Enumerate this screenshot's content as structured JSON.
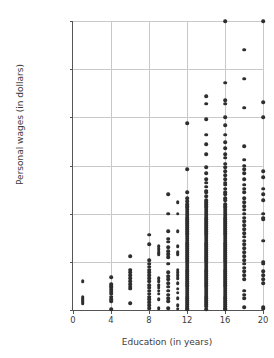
{
  "chart_data": {
    "type": "scatter",
    "title": "",
    "xlabel": "Education (in years)",
    "ylabel": "Personal wages (in dollars)",
    "xlim": [
      0,
      20
    ],
    "ylim": [
      0,
      150000
    ],
    "xticks": [
      0,
      4,
      8,
      12,
      16,
      20
    ],
    "xtick_labels": [
      "0",
      "4",
      "8",
      "12",
      "16",
      "20"
    ],
    "yticks": [
      0,
      25000,
      50000,
      75000,
      100000,
      125000,
      150000
    ],
    "ytick_labels": [
      "0",
      "25,000",
      "50,000",
      "75,000",
      "100,000",
      "125,000",
      "150,000"
    ],
    "grid": "horizontal-and-vertical",
    "legend": "none",
    "marker_color": "#2e2e2e",
    "grid_color": "#c9c9c9",
    "axis_color": "#555555",
    "points": [
      [
        1,
        15000
      ],
      [
        1,
        6500
      ],
      [
        1,
        5500
      ],
      [
        1,
        4500
      ],
      [
        1,
        3500
      ],
      [
        4,
        17000
      ],
      [
        4,
        13500
      ],
      [
        4,
        12500
      ],
      [
        4,
        11500
      ],
      [
        4,
        10500
      ],
      [
        4,
        9500
      ],
      [
        4,
        8500
      ],
      [
        4,
        7000
      ],
      [
        4,
        5500
      ],
      [
        4,
        4500
      ],
      [
        4,
        500
      ],
      [
        6,
        28000
      ],
      [
        6,
        21000
      ],
      [
        6,
        19500
      ],
      [
        6,
        18000
      ],
      [
        6,
        16500
      ],
      [
        6,
        15000
      ],
      [
        6,
        13500
      ],
      [
        6,
        12000
      ],
      [
        6,
        11000
      ],
      [
        6,
        3500
      ],
      [
        8,
        39000
      ],
      [
        8,
        34000
      ],
      [
        8,
        26000
      ],
      [
        8,
        24000
      ],
      [
        8,
        22500
      ],
      [
        8,
        21000
      ],
      [
        8,
        19500
      ],
      [
        8,
        18000
      ],
      [
        8,
        16500
      ],
      [
        8,
        15000
      ],
      [
        8,
        13000
      ],
      [
        8,
        11500
      ],
      [
        8,
        10000
      ],
      [
        8,
        8500
      ],
      [
        8,
        7000
      ],
      [
        8,
        5500
      ],
      [
        8,
        4000
      ],
      [
        8,
        2500
      ],
      [
        8,
        800
      ],
      [
        9,
        33000
      ],
      [
        9,
        31500
      ],
      [
        9,
        30000
      ],
      [
        9,
        29000
      ],
      [
        9,
        16500
      ],
      [
        9,
        15000
      ],
      [
        9,
        13000
      ],
      [
        9,
        11500
      ],
      [
        9,
        10000
      ],
      [
        9,
        8500
      ],
      [
        9,
        5500
      ],
      [
        9,
        1000
      ],
      [
        10,
        60000
      ],
      [
        10,
        50000
      ],
      [
        10,
        41000
      ],
      [
        10,
        37000
      ],
      [
        10,
        35500
      ],
      [
        10,
        32500
      ],
      [
        10,
        30500
      ],
      [
        10,
        29000
      ],
      [
        10,
        27500
      ],
      [
        10,
        24000
      ],
      [
        10,
        19500
      ],
      [
        10,
        17500
      ],
      [
        10,
        16000
      ],
      [
        10,
        14000
      ],
      [
        10,
        12000
      ],
      [
        10,
        10000
      ],
      [
        10,
        8000
      ],
      [
        10,
        6000
      ],
      [
        10,
        4500
      ],
      [
        10,
        1000
      ],
      [
        11,
        56000
      ],
      [
        11,
        50000
      ],
      [
        11,
        41000
      ],
      [
        11,
        33000
      ],
      [
        11,
        30000
      ],
      [
        11,
        29000
      ],
      [
        11,
        21000
      ],
      [
        11,
        19500
      ],
      [
        11,
        18000
      ],
      [
        11,
        16500
      ],
      [
        11,
        14000
      ],
      [
        11,
        11000
      ],
      [
        11,
        9000
      ],
      [
        11,
        6000
      ],
      [
        11,
        2500
      ],
      [
        11,
        700
      ],
      [
        12,
        97000
      ],
      [
        12,
        73000
      ],
      [
        12,
        61000
      ],
      [
        12,
        58000
      ],
      [
        12,
        56500
      ],
      [
        12,
        55000
      ],
      [
        12,
        54000
      ],
      [
        12,
        53000
      ],
      [
        12,
        52000
      ],
      [
        12,
        51000
      ],
      [
        12,
        50000
      ],
      [
        12,
        49000
      ],
      [
        12,
        48000
      ],
      [
        12,
        47000
      ],
      [
        12,
        46000
      ],
      [
        12,
        45000
      ],
      [
        12,
        44000
      ],
      [
        12,
        43000
      ],
      [
        12,
        42000
      ],
      [
        12,
        41000
      ],
      [
        12,
        40000
      ],
      [
        12,
        39000
      ],
      [
        12,
        38000
      ],
      [
        12,
        37000
      ],
      [
        12,
        36000
      ],
      [
        12,
        35000
      ],
      [
        12,
        34000
      ],
      [
        12,
        33000
      ],
      [
        12,
        32000
      ],
      [
        12,
        31000
      ],
      [
        12,
        30000
      ],
      [
        12,
        29000
      ],
      [
        12,
        28000
      ],
      [
        12,
        27000
      ],
      [
        12,
        26000
      ],
      [
        12,
        25000
      ],
      [
        12,
        24000
      ],
      [
        12,
        23000
      ],
      [
        12,
        22000
      ],
      [
        12,
        21000
      ],
      [
        12,
        20000
      ],
      [
        12,
        19000
      ],
      [
        12,
        18000
      ],
      [
        12,
        17000
      ],
      [
        12,
        16000
      ],
      [
        12,
        15000
      ],
      [
        12,
        14000
      ],
      [
        12,
        13000
      ],
      [
        12,
        12000
      ],
      [
        12,
        11000
      ],
      [
        12,
        10000
      ],
      [
        12,
        9000
      ],
      [
        12,
        8000
      ],
      [
        12,
        7000
      ],
      [
        12,
        6000
      ],
      [
        12,
        5000
      ],
      [
        12,
        4000
      ],
      [
        12,
        3000
      ],
      [
        12,
        2000
      ],
      [
        12,
        1000
      ],
      [
        12,
        300
      ],
      [
        14,
        111000
      ],
      [
        14,
        107000
      ],
      [
        14,
        99000
      ],
      [
        14,
        91000
      ],
      [
        14,
        86000
      ],
      [
        14,
        81000
      ],
      [
        14,
        74000
      ],
      [
        14,
        71000
      ],
      [
        14,
        68000
      ],
      [
        14,
        66000
      ],
      [
        14,
        64000
      ],
      [
        14,
        62000
      ],
      [
        14,
        61000
      ],
      [
        14,
        59000
      ],
      [
        14,
        57000
      ],
      [
        14,
        56000
      ],
      [
        14,
        55000
      ],
      [
        14,
        54000
      ],
      [
        14,
        53000
      ],
      [
        14,
        52000
      ],
      [
        14,
        51000
      ],
      [
        14,
        50000
      ],
      [
        14,
        49000
      ],
      [
        14,
        48000
      ],
      [
        14,
        47000
      ],
      [
        14,
        46000
      ],
      [
        14,
        45000
      ],
      [
        14,
        44000
      ],
      [
        14,
        43000
      ],
      [
        14,
        42000
      ],
      [
        14,
        41000
      ],
      [
        14,
        40000
      ],
      [
        14,
        39000
      ],
      [
        14,
        38000
      ],
      [
        14,
        37000
      ],
      [
        14,
        36000
      ],
      [
        14,
        35000
      ],
      [
        14,
        34000
      ],
      [
        14,
        33000
      ],
      [
        14,
        32000
      ],
      [
        14,
        31000
      ],
      [
        14,
        30000
      ],
      [
        14,
        29000
      ],
      [
        14,
        28000
      ],
      [
        14,
        27000
      ],
      [
        14,
        26000
      ],
      [
        14,
        25000
      ],
      [
        14,
        24000
      ],
      [
        14,
        23000
      ],
      [
        14,
        22000
      ],
      [
        14,
        21000
      ],
      [
        14,
        20000
      ],
      [
        14,
        19000
      ],
      [
        14,
        18000
      ],
      [
        14,
        17000
      ],
      [
        14,
        16000
      ],
      [
        14,
        15000
      ],
      [
        14,
        14000
      ],
      [
        14,
        13000
      ],
      [
        14,
        12000
      ],
      [
        14,
        11000
      ],
      [
        14,
        10000
      ],
      [
        14,
        9000
      ],
      [
        14,
        8000
      ],
      [
        14,
        7000
      ],
      [
        14,
        6000
      ],
      [
        14,
        5000
      ],
      [
        14,
        4000
      ],
      [
        14,
        3000
      ],
      [
        14,
        2000
      ],
      [
        14,
        500
      ],
      [
        16,
        150000
      ],
      [
        16,
        118000
      ],
      [
        16,
        109000
      ],
      [
        16,
        107000
      ],
      [
        16,
        100000
      ],
      [
        16,
        96000
      ],
      [
        16,
        91000
      ],
      [
        16,
        87000
      ],
      [
        16,
        84000
      ],
      [
        16,
        81000
      ],
      [
        16,
        79000
      ],
      [
        16,
        76000
      ],
      [
        16,
        74000
      ],
      [
        16,
        72000
      ],
      [
        16,
        70000
      ],
      [
        16,
        68000
      ],
      [
        16,
        66000
      ],
      [
        16,
        65000
      ],
      [
        16,
        63000
      ],
      [
        16,
        61000
      ],
      [
        16,
        60000
      ],
      [
        16,
        58000
      ],
      [
        16,
        57000
      ],
      [
        16,
        55000
      ],
      [
        16,
        54000
      ],
      [
        16,
        53000
      ],
      [
        16,
        52000
      ],
      [
        16,
        51000
      ],
      [
        16,
        50000
      ],
      [
        16,
        49000
      ],
      [
        16,
        48000
      ],
      [
        16,
        47000
      ],
      [
        16,
        46000
      ],
      [
        16,
        45000
      ],
      [
        16,
        44000
      ],
      [
        16,
        43000
      ],
      [
        16,
        42000
      ],
      [
        16,
        41000
      ],
      [
        16,
        40000
      ],
      [
        16,
        39000
      ],
      [
        16,
        38000
      ],
      [
        16,
        37000
      ],
      [
        16,
        36000
      ],
      [
        16,
        35000
      ],
      [
        16,
        34000
      ],
      [
        16,
        33000
      ],
      [
        16,
        32000
      ],
      [
        16,
        31000
      ],
      [
        16,
        30000
      ],
      [
        16,
        29000
      ],
      [
        16,
        28000
      ],
      [
        16,
        27000
      ],
      [
        16,
        26000
      ],
      [
        16,
        25000
      ],
      [
        16,
        24000
      ],
      [
        16,
        23000
      ],
      [
        16,
        22000
      ],
      [
        16,
        21000
      ],
      [
        16,
        20000
      ],
      [
        16,
        19000
      ],
      [
        16,
        18000
      ],
      [
        16,
        17000
      ],
      [
        16,
        16000
      ],
      [
        16,
        15000
      ],
      [
        16,
        14000
      ],
      [
        16,
        13000
      ],
      [
        16,
        12000
      ],
      [
        16,
        11000
      ],
      [
        16,
        10000
      ],
      [
        16,
        9000
      ],
      [
        16,
        8000
      ],
      [
        16,
        7000
      ],
      [
        16,
        6000
      ],
      [
        16,
        5000
      ],
      [
        16,
        4000
      ],
      [
        16,
        3000
      ],
      [
        16,
        2000
      ],
      [
        16,
        1000
      ],
      [
        16,
        300
      ],
      [
        18,
        135000
      ],
      [
        18,
        120000
      ],
      [
        18,
        105000
      ],
      [
        18,
        85000
      ],
      [
        18,
        78000
      ],
      [
        18,
        75000
      ],
      [
        18,
        73000
      ],
      [
        18,
        71000
      ],
      [
        18,
        68000
      ],
      [
        18,
        65000
      ],
      [
        18,
        63000
      ],
      [
        18,
        61000
      ],
      [
        18,
        58000
      ],
      [
        18,
        56000
      ],
      [
        18,
        54000
      ],
      [
        18,
        52000
      ],
      [
        18,
        50000
      ],
      [
        18,
        48000
      ],
      [
        18,
        46000
      ],
      [
        18,
        44000
      ],
      [
        18,
        42000
      ],
      [
        18,
        40000
      ],
      [
        18,
        38000
      ],
      [
        18,
        36000
      ],
      [
        18,
        34000
      ],
      [
        18,
        32000
      ],
      [
        18,
        30000
      ],
      [
        18,
        28000
      ],
      [
        18,
        26000
      ],
      [
        18,
        24000
      ],
      [
        18,
        22000
      ],
      [
        18,
        20000
      ],
      [
        18,
        18000
      ],
      [
        18,
        16000
      ],
      [
        18,
        10000
      ],
      [
        18,
        8000
      ],
      [
        18,
        6000
      ],
      [
        18,
        1500
      ],
      [
        20,
        150000
      ],
      [
        20,
        108000
      ],
      [
        20,
        100000
      ],
      [
        20,
        72000
      ],
      [
        20,
        69000
      ],
      [
        20,
        63000
      ],
      [
        20,
        60000
      ],
      [
        20,
        57000
      ],
      [
        20,
        50000
      ],
      [
        20,
        48000
      ],
      [
        20,
        47000
      ],
      [
        20,
        36000
      ],
      [
        20,
        25000
      ],
      [
        20,
        24000
      ],
      [
        20,
        20000
      ],
      [
        20,
        18000
      ],
      [
        20,
        16000
      ],
      [
        20,
        14000
      ],
      [
        20,
        1500
      ],
      [
        20,
        600
      ]
    ]
  }
}
